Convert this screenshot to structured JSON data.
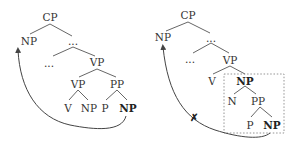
{
  "diagrams": [
    {
      "name": "left-tree",
      "nodes": {
        "cp": "CP",
        "np_spec": "NP",
        "dots1": "...",
        "dots2": "...",
        "vp_top": "VP",
        "vp_low": "VP",
        "pp": "PP",
        "v": "V",
        "np_obj": "NP",
        "p": "P",
        "np_moved": "NP"
      },
      "movement": "NP extracted from PP adjunct to spec position (allowed)"
    },
    {
      "name": "right-tree",
      "nodes": {
        "cp": "CP",
        "np_spec": "NP",
        "dots1": "...",
        "dots2": "...",
        "vp": "VP",
        "v": "V",
        "np_complex": "NP",
        "n": "N",
        "pp": "PP",
        "p": "P",
        "np_moved": "NP"
      },
      "blocked_mark": "✗",
      "movement": "NP extraction out of complex NP island (blocked)"
    }
  ],
  "colors": {
    "text": "#333333",
    "edges": "#555555",
    "arrow": "#444444",
    "box": "#888888"
  }
}
